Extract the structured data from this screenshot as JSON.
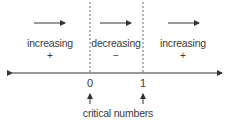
{
  "diagram": {
    "intervals": [
      {
        "label": "increasing",
        "sign": "+",
        "center_x": 50
      },
      {
        "label": "decreasing",
        "sign": "−",
        "center_x": 116
      },
      {
        "label": "increasing",
        "sign": "+",
        "center_x": 183
      }
    ],
    "critical_points": [
      {
        "value": "0",
        "x": 90
      },
      {
        "value": "1",
        "x": 143
      }
    ],
    "caption": "critical numbers",
    "colors": {
      "line": "#333333",
      "text": "#3a3a3a",
      "dashed": "#666666"
    }
  }
}
